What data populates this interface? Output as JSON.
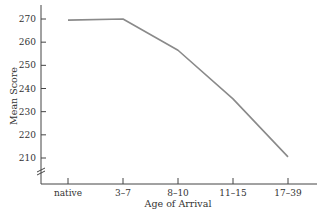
{
  "chart_data": {
    "type": "line",
    "title": "",
    "xlabel": "Age of Arrival",
    "ylabel": "Mean Score",
    "categories": [
      "native",
      "3–7",
      "8–10",
      "11–15",
      "17–39"
    ],
    "series": [
      {
        "name": "Mean Score",
        "values": [
          269.5,
          270,
          256.5,
          235.5,
          210.5
        ]
      }
    ],
    "yticks": [
      210,
      220,
      230,
      240,
      250,
      260,
      270
    ],
    "ylim": [
      203,
      275
    ],
    "y_axis_break": true,
    "grid": false,
    "legend": false,
    "line_color": "#8a8a8a",
    "axis_color": "#444444"
  }
}
